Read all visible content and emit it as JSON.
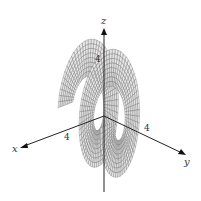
{
  "figure": {
    "axes": {
      "x_label": "x",
      "y_label": "y",
      "z_label": "z",
      "x_tick": "4",
      "y_tick": "4",
      "z_tick": "4"
    },
    "surface": {
      "type": "spiral ramp",
      "turns": 2,
      "color": "#e6e6e6",
      "mesh_color": "#555555"
    }
  }
}
